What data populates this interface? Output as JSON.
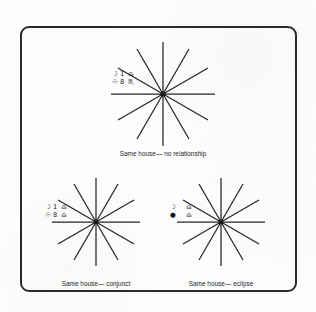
{
  "figure": {
    "type": "diagram",
    "background_color": "#fefefe",
    "ink_color": "#2b2b2b",
    "frame": {
      "border_color": "#2b2b2b",
      "corner_radius": "9px"
    }
  },
  "charts": [
    {
      "id": "top",
      "caption": "Same house— no relationship",
      "spokes": 12,
      "placements": [
        {
          "body": "☽",
          "body_name": "moon-symbol",
          "degree": "1",
          "sign": "♎",
          "sign_name": "libra-symbol"
        },
        {
          "body": "☉",
          "body_name": "sun-symbol",
          "degree": "8",
          "sign": "♏",
          "sign_name": "scorpio-symbol"
        }
      ]
    },
    {
      "id": "bottom-left",
      "caption": "Same house— conjunct",
      "spokes": 12,
      "placements": [
        {
          "body": "☽",
          "body_name": "moon-symbol",
          "degree": "1",
          "sign": "♎",
          "sign_name": "libra-symbol"
        },
        {
          "body": "☉",
          "body_name": "sun-symbol",
          "degree": "8",
          "sign": "♎",
          "sign_name": "libra-symbol"
        }
      ]
    },
    {
      "id": "bottom-right",
      "caption": "Same house— eclipse",
      "spokes": 12,
      "placements": [
        {
          "body": "☽",
          "body_name": "moon-symbol",
          "degree": "",
          "sign": "♎",
          "sign_name": "libra-symbol"
        },
        {
          "body": "●",
          "body_name": "eclipsed-sun-symbol",
          "degree": "",
          "sign": "♎",
          "sign_name": "libra-symbol"
        }
      ]
    }
  ]
}
